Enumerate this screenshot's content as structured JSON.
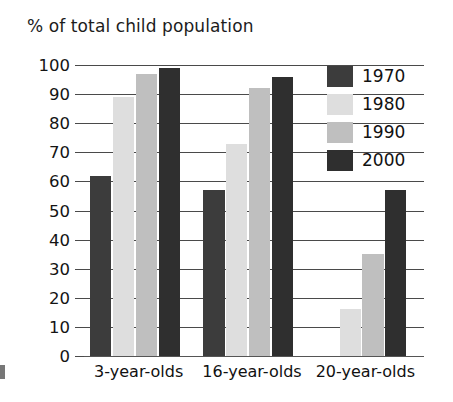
{
  "chart_data": {
    "type": "bar",
    "title": "% of total child population",
    "xlabel": "",
    "ylabel": "",
    "ylim": [
      0,
      100
    ],
    "yticks": [
      0,
      10,
      20,
      30,
      40,
      50,
      60,
      70,
      80,
      90,
      100
    ],
    "ytick_labels": [
      "0",
      "10",
      "20",
      "30",
      "40",
      "50",
      "60",
      "70",
      "80",
      "90",
      "100"
    ],
    "grid": true,
    "legend_position": "top-right",
    "categories": [
      "3-year-olds",
      "16-year-olds",
      "20-year-olds"
    ],
    "series": [
      {
        "name": "1970",
        "color": "#3c3c3c",
        "values": [
          62,
          57,
          0
        ]
      },
      {
        "name": "1980",
        "color": "#dedede",
        "values": [
          89,
          73,
          16
        ]
      },
      {
        "name": "1990",
        "color": "#bfbfbf",
        "values": [
          97,
          92,
          35
        ]
      },
      {
        "name": "2000",
        "color": "#2f2f2f",
        "values": [
          99,
          96,
          57
        ]
      }
    ]
  },
  "legend": {
    "items": [
      {
        "label": "1970"
      },
      {
        "label": "1980"
      },
      {
        "label": "1990"
      },
      {
        "label": "2000"
      }
    ]
  }
}
